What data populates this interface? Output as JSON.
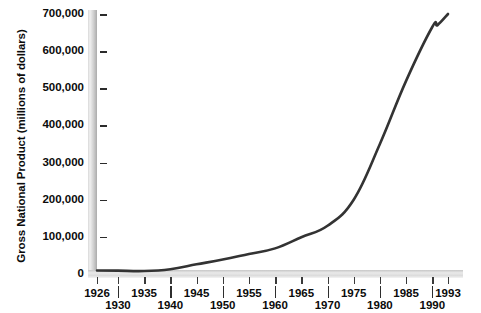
{
  "chart_data": {
    "type": "line",
    "title": "",
    "xlabel": "",
    "ylabel": "Gross National Product (millions of dollars)",
    "xlim": [
      1926,
      1993
    ],
    "ylim": [
      0,
      700000
    ],
    "grid": false,
    "legend": null,
    "y_ticks": [
      0,
      100000,
      200000,
      300000,
      400000,
      500000,
      600000,
      700000
    ],
    "y_tick_labels": [
      "0",
      "100,000",
      "200,000",
      "300,000",
      "400,000",
      "500,000",
      "600,000",
      "700,000"
    ],
    "x_ticks": [
      1926,
      1930,
      1935,
      1940,
      1945,
      1950,
      1955,
      1960,
      1965,
      1970,
      1975,
      1980,
      1985,
      1990,
      1993
    ],
    "x_tick_labels": [
      "1926",
      "1930",
      "1935",
      "1940",
      "1945",
      "1950",
      "1955",
      "1960",
      "1965",
      "1970",
      "1975",
      "1980",
      "1985",
      "1990",
      "1993"
    ],
    "x_tick_label_rows": [
      "top",
      "bottom",
      "top",
      "bottom",
      "top",
      "bottom",
      "top",
      "bottom",
      "top",
      "bottom",
      "top",
      "bottom",
      "top",
      "bottom",
      "top"
    ],
    "line_color": "#333333",
    "axis_color": "#d5d5d5",
    "series": [
      {
        "name": "Gross National Product",
        "x": [
          1926,
          1930,
          1935,
          1940,
          1945,
          1950,
          1955,
          1960,
          1965,
          1970,
          1975,
          1980,
          1985,
          1990,
          1991,
          1993
        ],
        "values": [
          9500,
          9000,
          8000,
          13000,
          26000,
          39000,
          54000,
          69000,
          99000,
          130000,
          200000,
          350000,
          520000,
          665000,
          670000,
          700000
        ]
      }
    ]
  }
}
